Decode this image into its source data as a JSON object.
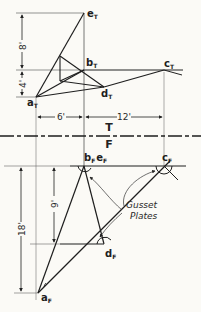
{
  "diagram": {
    "type": "orthographic-projection",
    "folding_line": {
      "upper_label": "T",
      "lower_label": "F"
    },
    "top_view": {
      "points": {
        "e": {
          "label": "e",
          "sub": "T"
        },
        "b": {
          "label": "b",
          "sub": "T"
        },
        "c": {
          "label": "c",
          "sub": "T"
        },
        "d": {
          "label": "d",
          "sub": "T"
        },
        "a": {
          "label": "a",
          "sub": "T"
        }
      },
      "dimensions": {
        "vertical_upper": "8'",
        "vertical_lower": "4'",
        "horizontal_left": "6'",
        "horizontal_right": "12'"
      }
    },
    "front_view": {
      "points": {
        "be": {
          "label": "b",
          "sub": "F",
          "label2": "e",
          "sub2": "F"
        },
        "c": {
          "label": "c",
          "sub": "F"
        },
        "d": {
          "label": "d",
          "sub": "F"
        },
        "a": {
          "label": "a",
          "sub": "F"
        }
      },
      "dimensions": {
        "inner_vertical": "9'",
        "outer_vertical": "18'"
      },
      "annotation": {
        "line1": "Gusset",
        "line2": "Plates"
      }
    }
  },
  "colors": {
    "ink": "#1e1e1e",
    "paper": "#fbfaf6",
    "thin": "#555555"
  }
}
